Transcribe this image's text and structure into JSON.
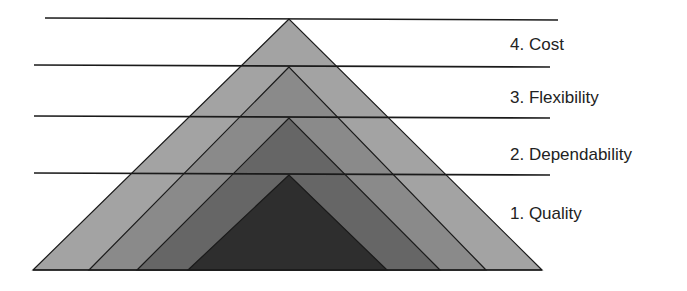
{
  "diagram": {
    "type": "layered-pyramid",
    "layers": [
      {
        "rank": 1,
        "label": "1. Quality",
        "fill": "#2e2e2e",
        "apex": [
          289,
          175
        ],
        "base": [
          188,
          387
        ],
        "label_pos": [
          510,
          205
        ]
      },
      {
        "rank": 2,
        "label": "2. Dependability",
        "fill": "#666666",
        "apex": [
          289,
          118
        ],
        "base": [
          137,
          440
        ],
        "label_pos": [
          510,
          146
        ]
      },
      {
        "rank": 3,
        "label": "3. Flexibility",
        "fill": "#8a8a8a",
        "apex": [
          289,
          67
        ],
        "base": [
          89,
          486
        ],
        "label_pos": [
          510,
          89
        ]
      },
      {
        "rank": 4,
        "label": "4. Cost",
        "fill": "#a3a3a3",
        "apex": [
          289,
          19
        ],
        "base": [
          33,
          542
        ],
        "label_pos": [
          510,
          36
        ]
      }
    ],
    "base_y": 270,
    "dividers": [
      {
        "x1": 45,
        "y1": 18,
        "x2": 558,
        "y2": 20
      },
      {
        "x1": 34,
        "y1": 65,
        "x2": 550,
        "y2": 67
      },
      {
        "x1": 34,
        "y1": 116,
        "x2": 550,
        "y2": 118
      },
      {
        "x1": 34,
        "y1": 173,
        "x2": 550,
        "y2": 175
      }
    ],
    "stroke": "#1a1a1a"
  }
}
